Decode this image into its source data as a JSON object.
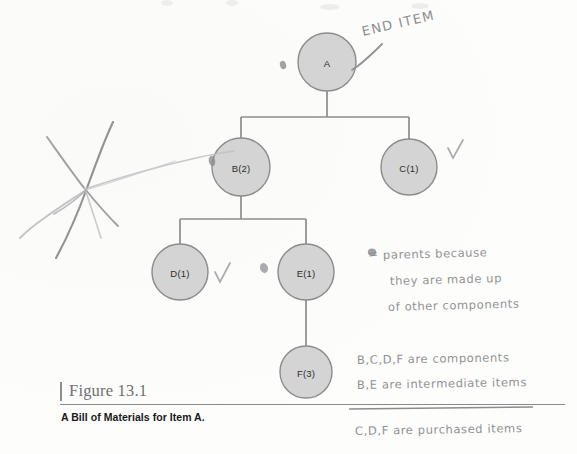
{
  "figure": {
    "number_label": "Figure 13.1",
    "caption": "A Bill of Materials for Item A."
  },
  "diagram": {
    "node_fill": "#d4d4d4",
    "node_stroke": "#8c8c8c",
    "connector_color": "#8c8c8c",
    "nodes": [
      {
        "id": "A",
        "label": "A",
        "cx": 327,
        "cy": 62,
        "r": 29,
        "level": 0,
        "marked_parent": true,
        "checked": false
      },
      {
        "id": "B",
        "label": "B(2)",
        "cx": 241,
        "cy": 167,
        "r": 29,
        "level": 1,
        "marked_parent": true,
        "checked": false
      },
      {
        "id": "C",
        "label": "C(1)",
        "cx": 409,
        "cy": 167,
        "r": 28,
        "level": 1,
        "marked_parent": false,
        "checked": true
      },
      {
        "id": "D",
        "label": "D(1)",
        "cx": 180,
        "cy": 272,
        "r": 28,
        "level": 2,
        "marked_parent": false,
        "checked": true
      },
      {
        "id": "E",
        "label": "E(1)",
        "cx": 306,
        "cy": 272,
        "r": 28,
        "level": 2,
        "marked_parent": true,
        "checked": false
      },
      {
        "id": "F",
        "label": "F(3)",
        "cx": 306,
        "cy": 372,
        "r": 26,
        "level": 3,
        "marked_parent": false,
        "checked": false
      }
    ],
    "edges": [
      {
        "from": "A",
        "to": "B"
      },
      {
        "from": "A",
        "to": "C"
      },
      {
        "from": "B",
        "to": "D"
      },
      {
        "from": "B",
        "to": "E"
      },
      {
        "from": "E",
        "to": "F"
      }
    ]
  },
  "annotations": {
    "end_item": "END ITEM",
    "legend_equals": "=",
    "parents_line1": "parents  because",
    "parents_line2": "they  are  made  up",
    "parents_line3": "of other  components",
    "components_note": "B,C,D,F  are  components",
    "intermediate_note": "B,E  are  intermediate items",
    "purchased_note": "C,D,F  are  purchased items",
    "check_mark": "✓"
  }
}
